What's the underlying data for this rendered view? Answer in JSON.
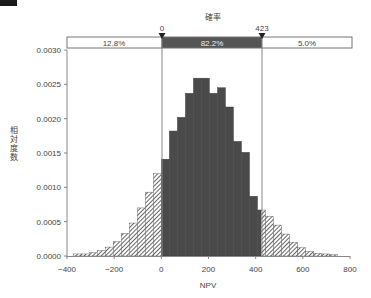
{
  "header": {
    "probability_label": "確率"
  },
  "markers": {
    "left_value": "0",
    "right_value": "423"
  },
  "probability_bar": {
    "left_pct": "12.8%",
    "middle_pct": "82.2%",
    "right_pct": "5.0%"
  },
  "colors": {
    "middle_fill": "#555555",
    "bar_dark": "#4a4a4a",
    "hatch": "#666666"
  },
  "chart_data": {
    "type": "bar",
    "title": "確率",
    "xlabel": "NPV",
    "ylabel": "相対度数",
    "xlim": [
      -400,
      800
    ],
    "ylim": [
      0,
      0.003
    ],
    "x_ticks": [
      "−400",
      "−200",
      "0",
      "200",
      "400",
      "600",
      "800"
    ],
    "y_ticks": [
      "0.0000",
      "0.0005",
      "0.0010",
      "0.0015",
      "0.0020",
      "0.0025",
      "0.0030"
    ],
    "grid": false,
    "bin_width": 34,
    "bins_start": [
      -374,
      -340,
      -306,
      -272,
      -238,
      -204,
      -170,
      -136,
      -102,
      -68,
      -34,
      0,
      34,
      68,
      102,
      136,
      170,
      204,
      238,
      272,
      306,
      340,
      374,
      408,
      442,
      476,
      510,
      544,
      578,
      612,
      646,
      680,
      714
    ],
    "values": [
      3e-05,
      3e-05,
      5e-05,
      8e-05,
      0.00013,
      0.00021,
      0.00033,
      0.00048,
      0.0007,
      0.00093,
      0.0012,
      0.00141,
      0.00182,
      0.00202,
      0.00237,
      0.00259,
      0.00259,
      0.00237,
      0.00245,
      0.00217,
      0.00167,
      0.00151,
      0.00087,
      0.00067,
      0.00058,
      0.00045,
      0.00032,
      0.0002,
      0.00012,
      7e-05,
      4e-05,
      3e-05,
      2e-05
    ],
    "regions": [
      {
        "name": "left",
        "range": [
          -400,
          0
        ],
        "probability": "12.8%",
        "style": "hatched"
      },
      {
        "name": "middle",
        "range": [
          0,
          423
        ],
        "probability": "82.2%",
        "style": "solid-dark"
      },
      {
        "name": "right",
        "range": [
          423,
          800
        ],
        "probability": "5.0%",
        "style": "hatched"
      }
    ],
    "delimiters": [
      0,
      423
    ]
  }
}
